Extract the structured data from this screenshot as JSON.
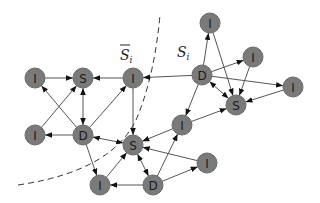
{
  "labels": {
    "s_bar": "S",
    "s_bar_sub": "i",
    "s_i": "S",
    "s_i_sub": "i"
  },
  "nodes": [
    {
      "id": "I1",
      "label": "I",
      "x": 35,
      "y": 78
    },
    {
      "id": "S1",
      "label": "S",
      "x": 83,
      "y": 78
    },
    {
      "id": "I2",
      "label": "I",
      "x": 133,
      "y": 78
    },
    {
      "id": "I3",
      "label": "I",
      "x": 35,
      "y": 135
    },
    {
      "id": "D1",
      "label": "D",
      "x": 83,
      "y": 135
    },
    {
      "id": "S2",
      "label": "S",
      "x": 133,
      "y": 145
    },
    {
      "id": "I4",
      "label": "I",
      "x": 100,
      "y": 185
    },
    {
      "id": "D2",
      "label": "D",
      "x": 153,
      "y": 185
    },
    {
      "id": "I5",
      "label": "I",
      "x": 207,
      "y": 163
    },
    {
      "id": "I6",
      "label": "I",
      "x": 182,
      "y": 125
    },
    {
      "id": "D3",
      "label": "D",
      "x": 202,
      "y": 75
    },
    {
      "id": "I7",
      "label": "I",
      "x": 210,
      "y": 23
    },
    {
      "id": "I8",
      "label": "I",
      "x": 253,
      "y": 57
    },
    {
      "id": "I9",
      "label": "I",
      "x": 293,
      "y": 87
    },
    {
      "id": "S3",
      "label": "S",
      "x": 236,
      "y": 105
    }
  ],
  "edges": [
    {
      "from": "I1",
      "to": "S1",
      "dir": "forward"
    },
    {
      "from": "I2",
      "to": "S1",
      "dir": "forward"
    },
    {
      "from": "S1",
      "to": "D1",
      "dir": "both"
    },
    {
      "from": "D1",
      "to": "I1",
      "dir": "forward"
    },
    {
      "from": "I3",
      "to": "S1",
      "dir": "forward"
    },
    {
      "from": "D1",
      "to": "I3",
      "dir": "forward"
    },
    {
      "from": "D1",
      "to": "I2",
      "dir": "forward"
    },
    {
      "from": "D3",
      "to": "I2",
      "dir": "forward"
    },
    {
      "from": "I2",
      "to": "S2",
      "dir": "forward"
    },
    {
      "from": "D1",
      "to": "S2",
      "dir": "both"
    },
    {
      "from": "D1",
      "to": "I4",
      "dir": "forward"
    },
    {
      "from": "I4",
      "to": "S2",
      "dir": "forward"
    },
    {
      "from": "D2",
      "to": "I4",
      "dir": "forward"
    },
    {
      "from": "S2",
      "to": "D2",
      "dir": "both"
    },
    {
      "from": "D2",
      "to": "I6",
      "dir": "forward"
    },
    {
      "from": "D2",
      "to": "I5",
      "dir": "forward"
    },
    {
      "from": "I5",
      "to": "S2",
      "dir": "forward"
    },
    {
      "from": "I6",
      "to": "S2",
      "dir": "forward"
    },
    {
      "from": "I6",
      "to": "S3",
      "dir": "forward"
    },
    {
      "from": "D3",
      "to": "I6",
      "dir": "forward"
    },
    {
      "from": "D3",
      "to": "I7",
      "dir": "forward"
    },
    {
      "from": "D3",
      "to": "I8",
      "dir": "forward"
    },
    {
      "from": "D3",
      "to": "I9",
      "dir": "forward"
    },
    {
      "from": "D3",
      "to": "S3",
      "dir": "both"
    },
    {
      "from": "I7",
      "to": "S3",
      "dir": "forward"
    },
    {
      "from": "I8",
      "to": "S3",
      "dir": "forward"
    },
    {
      "from": "I9",
      "to": "S3",
      "dir": "forward"
    }
  ]
}
